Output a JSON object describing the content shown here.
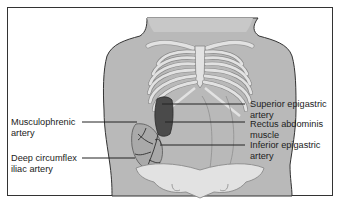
{
  "figure": {
    "colors": {
      "skin": "#b9b9b9",
      "bone": "#e2e2e2",
      "muscle": "#4a4a4a",
      "outline": "#333333",
      "frame": "#333333",
      "text": "#222222"
    },
    "labels_left": [
      {
        "id": "musculophrenic",
        "line1": "Musculophrenic",
        "line2": "artery"
      },
      {
        "id": "deep-circumflex",
        "line1": "Deep circumflex",
        "line2": "iliac artery"
      }
    ],
    "labels_right": [
      {
        "id": "superior-epigastric",
        "line1": "Superior epigastric",
        "line2": "artery"
      },
      {
        "id": "rectus-abdominis",
        "line1": "Rectus abdominis",
        "line2": "muscle"
      },
      {
        "id": "inferior-epigastric",
        "line1": "Inferior epigastric",
        "line2": "artery"
      }
    ]
  }
}
